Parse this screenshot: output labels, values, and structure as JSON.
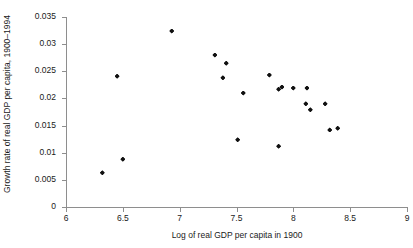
{
  "chart_data": {
    "type": "scatter",
    "title": "",
    "xlabel": "Log of real GDP per capita in 1900",
    "ylabel": "Growth rate of real GDP per capita, 1900–1994",
    "xlim": [
      6,
      9
    ],
    "ylim": [
      0,
      0.035
    ],
    "xticks": [
      6,
      6.5,
      7,
      7.5,
      8,
      8.5,
      9
    ],
    "xticklabels": [
      "6",
      "6.5",
      "7",
      "7.5",
      "8",
      "8.5",
      "9"
    ],
    "yticks": [
      0,
      0.005,
      0.01,
      0.015,
      0.02,
      0.025,
      0.03,
      0.035
    ],
    "yticklabels": [
      "0",
      "0.005",
      "0.01",
      "0.015",
      "0.02",
      "0.025",
      "0.03",
      "0.035"
    ],
    "grid": false,
    "legend": null,
    "marker_color": "#111111",
    "axis_color": "#8e8e8e",
    "points": [
      {
        "x": 6.32,
        "y": 0.0063
      },
      {
        "x": 6.5,
        "y": 0.0088
      },
      {
        "x": 6.45,
        "y": 0.0241
      },
      {
        "x": 6.93,
        "y": 0.0324
      },
      {
        "x": 7.31,
        "y": 0.028
      },
      {
        "x": 7.41,
        "y": 0.0265
      },
      {
        "x": 7.38,
        "y": 0.0238
      },
      {
        "x": 7.51,
        "y": 0.0124
      },
      {
        "x": 7.56,
        "y": 0.021
      },
      {
        "x": 7.79,
        "y": 0.0243
      },
      {
        "x": 7.87,
        "y": 0.0217
      },
      {
        "x": 7.9,
        "y": 0.0221
      },
      {
        "x": 7.87,
        "y": 0.0112
      },
      {
        "x": 8.0,
        "y": 0.0219
      },
      {
        "x": 8.12,
        "y": 0.0219
      },
      {
        "x": 8.11,
        "y": 0.019
      },
      {
        "x": 8.15,
        "y": 0.0179
      },
      {
        "x": 8.28,
        "y": 0.019
      },
      {
        "x": 8.32,
        "y": 0.0142
      },
      {
        "x": 8.39,
        "y": 0.0145
      }
    ]
  }
}
